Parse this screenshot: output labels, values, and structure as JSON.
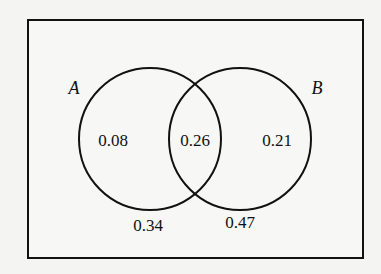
{
  "diagram": {
    "type": "venn",
    "sets": [
      {
        "name": "A",
        "label": "A"
      },
      {
        "name": "B",
        "label": "B"
      }
    ],
    "regions": {
      "a_only": "0.08",
      "a_and_b": "0.26",
      "b_only": "0.21"
    },
    "outside_labels": {
      "below_a": "0.34",
      "below_b": "0.47"
    },
    "colors": {
      "stroke": "#111111",
      "background": "#f7f7f5"
    }
  }
}
